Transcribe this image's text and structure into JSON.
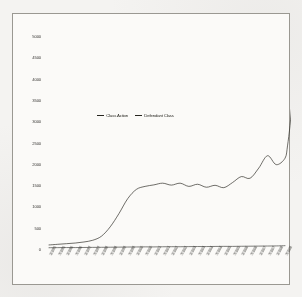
{
  "chart_data": {
    "type": "line",
    "title": "",
    "xlabel": "",
    "ylabel": "",
    "ylim": [
      0,
      5000
    ],
    "grid": false,
    "legend_position": "center",
    "ytick_labels": [
      "0",
      "500",
      "1000",
      "1500",
      "2000",
      "2500",
      "3000",
      "3500",
      "4000",
      "4500",
      "5000"
    ],
    "ytick_values": [
      0,
      500,
      1000,
      1500,
      2000,
      2500,
      3000,
      3500,
      4000,
      4500,
      5000
    ],
    "categories": [
      "1/1/95",
      "7/1/95",
      "1/1/96",
      "7/1/96",
      "1/1/97",
      "7/1/97",
      "1/1/98",
      "7/1/98",
      "1/1/99",
      "7/1/99",
      "1/1/00",
      "7/1/00",
      "1/1/01",
      "7/1/01",
      "1/1/02",
      "7/1/02",
      "1/1/03",
      "7/1/03",
      "1/1/04",
      "7/1/04",
      "1/1/05",
      "7/1/05",
      "1/1/06",
      "7/1/06",
      "1/1/07",
      "7/1/07",
      "1/1/08",
      "7/1/08"
    ],
    "series": [
      {
        "name": "Class Action",
        "color": "#26251f",
        "values": [
          95,
          110,
          125,
          140,
          165,
          205,
          300,
          520,
          830,
          1180,
          1400,
          1470,
          1505,
          1545,
          1500,
          1545,
          1470,
          1520,
          1450,
          1495,
          1440,
          1560,
          1700,
          1660,
          1900,
          2190,
          1980,
          2130
        ]
      },
      {
        "name": "Defendant Class",
        "color": "#3a3936",
        "values": [
          30,
          32,
          34,
          33,
          36,
          38,
          40,
          42,
          44,
          46,
          48,
          50,
          49,
          52,
          54,
          53,
          56,
          58,
          57,
          60,
          62,
          61,
          64,
          66,
          68,
          70,
          72,
          78
        ]
      }
    ],
    "annotations": [
      "Class Action series surges steeply at the right edge, peaking near 4600"
    ]
  },
  "legend": {
    "entries": [
      {
        "label": "Class Action"
      },
      {
        "label": "Defendant Class"
      }
    ]
  }
}
